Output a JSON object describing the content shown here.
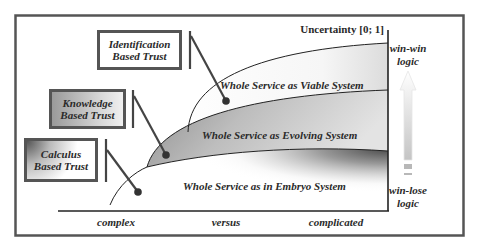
{
  "diagram": {
    "y_axis_label": "Uncertainty [0; 1]",
    "x_axis": {
      "labels": [
        "complex",
        "versus",
        "complicated"
      ]
    },
    "regions": [
      {
        "id": "viable",
        "label": "Whole Service as Viable System"
      },
      {
        "id": "evolving",
        "label": "Whole Service as Evolving System"
      },
      {
        "id": "embryo",
        "label": "Whole Service as in Embryo System"
      }
    ],
    "trust_boxes": [
      {
        "id": "identification",
        "line1": "Identification",
        "line2": "Based Trust"
      },
      {
        "id": "knowledge",
        "line1": "Knowledge",
        "line2": "Based Trust"
      },
      {
        "id": "calculus",
        "line1": "Calculus",
        "line2": "Based Trust"
      }
    ],
    "logic_scale": {
      "top_line1": "win-win",
      "top_line2": "logic",
      "bottom_line1": "win-lose",
      "bottom_line2": "logic"
    },
    "colors": {
      "frame": "#555555",
      "axis": "#222222",
      "evolving_fill": "#9a9a9a",
      "connector": "#444444"
    }
  }
}
